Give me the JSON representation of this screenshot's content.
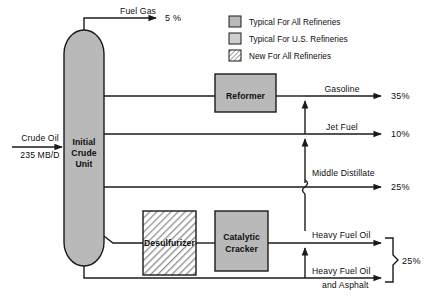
{
  "diagram": {
    "colors": {
      "fill_typical_all": "#b9b9b9",
      "fill_typical_us": "#c9c9c9",
      "hatch_new": "#b9b9b9",
      "stroke": "#1a1a1a",
      "background": "#ffffff"
    },
    "feed": {
      "name_line1": "Crude Oil",
      "name_line2": "235 MB/D",
      "arrow_icon": "right-arrow-icon"
    },
    "vessel": {
      "label_line1": "Initial",
      "label_line2": "Crude",
      "label_line3": "Unit",
      "fill_class": "typical-all-refineries"
    },
    "units": [
      {
        "id": "reformer",
        "label": "Reformer",
        "fill_class": "typical-all-refineries"
      },
      {
        "id": "desulfurizer",
        "label": "Desulfurizer",
        "fill_class": "new-for-all-refineries"
      },
      {
        "id": "catalytic-cracker",
        "label_line1": "Catalytic",
        "label_line2": "Cracker",
        "fill_class": "typical-us-refineries"
      }
    ],
    "legend": {
      "items": [
        {
          "swatch": "solid-gray-swatch",
          "label": "Typical For All Refineries"
        },
        {
          "swatch": "light-gray-swatch",
          "label": "Typical For U.S. Refineries"
        },
        {
          "swatch": "hatched-swatch",
          "label": "New For All Refineries"
        }
      ]
    },
    "streams": [
      {
        "id": "fuel-gas",
        "label": "Fuel Gas",
        "percent": "5 %"
      },
      {
        "id": "gasoline",
        "label": "Gasoline",
        "percent": "35%"
      },
      {
        "id": "jet-fuel",
        "label": "Jet Fuel",
        "percent": "10%"
      },
      {
        "id": "middle-distillate",
        "label": "Middle Distillate",
        "percent": "25%"
      },
      {
        "id": "heavy-fuel-oil",
        "label": "Heavy Fuel Oil",
        "percent": ""
      },
      {
        "id": "heavy-fuel-oil-asphalt",
        "label_line1": "Heavy Fuel Oil",
        "label_line2": "and Asphalt",
        "percent": ""
      }
    ],
    "grouped_percent": {
      "label": "25%",
      "groups": [
        "heavy-fuel-oil",
        "heavy-fuel-oil-asphalt"
      ],
      "brace_icon": "curly-brace-icon"
    }
  }
}
